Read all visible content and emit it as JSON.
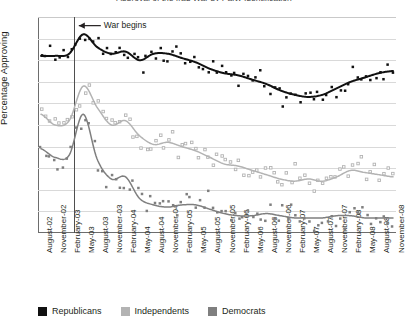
{
  "chart_data": {
    "type": "scatter",
    "title": "Approval of the Iraq War by Party Identification",
    "xlabel": "",
    "ylabel": "Percentage Approving",
    "ylim": [
      0,
      100
    ],
    "ytick_values": [
      0,
      10,
      20,
      30,
      40,
      50,
      60,
      70,
      80,
      90,
      100
    ],
    "grid": true,
    "legend_position": "bottom-left",
    "annotations": [
      {
        "text": "War begins",
        "x": "March-03",
        "note": "vertical reference line with left arrow"
      }
    ],
    "categories": [
      "August-02",
      "November-02",
      "February-03",
      "May-03",
      "August-03",
      "November-03",
      "February-04",
      "May-04",
      "August-04",
      "November-04",
      "February-05",
      "May-05",
      "August-05",
      "November-05",
      "February-06",
      "May-06",
      "August-06",
      "November-06",
      "February-07",
      "May-07",
      "August-07",
      "November-07",
      "February-08",
      "May-08",
      "August-08",
      "November-08"
    ],
    "series": [
      {
        "name": "Republicans",
        "color": "#111111",
        "marker": "filled-square",
        "trend": [
          82,
          82,
          83,
          92,
          86,
          83,
          84,
          80,
          83,
          83,
          81,
          79,
          76,
          74,
          73,
          71,
          69,
          66,
          64,
          63,
          64,
          67,
          70,
          72,
          74,
          75
        ]
      },
      {
        "name": "Independents",
        "color": "#b3b3b3",
        "marker": "open-square",
        "trend": [
          55,
          50,
          52,
          68,
          58,
          50,
          52,
          45,
          41,
          42,
          40,
          38,
          35,
          32,
          31,
          29,
          27,
          25,
          24,
          25,
          24,
          26,
          29,
          28,
          27,
          26
        ]
      },
      {
        "name": "Democrats",
        "color": "#7f7f7f",
        "marker": "filled-square",
        "trend": [
          39,
          35,
          36,
          55,
          34,
          25,
          26,
          16,
          13,
          12,
          13,
          13,
          11,
          9,
          8,
          8,
          9,
          8,
          7,
          7,
          7,
          8,
          8,
          7,
          7,
          7
        ]
      }
    ]
  },
  "legend": {
    "items": [
      {
        "label": "Republicans",
        "color": "#111111"
      },
      {
        "label": "Independents",
        "color": "#b3b3b3"
      },
      {
        "label": "Democrats",
        "color": "#7f7f7f"
      }
    ]
  }
}
